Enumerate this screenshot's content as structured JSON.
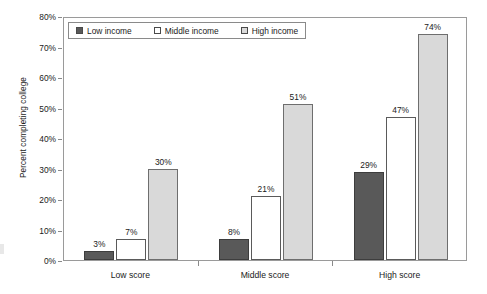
{
  "chart_data": {
    "type": "bar",
    "title": "",
    "subtitle": "",
    "xlabel": "",
    "ylabel": "Percent completing college",
    "categories": [
      "Low score",
      "Middle score",
      "High score"
    ],
    "series": [
      {
        "name": "Low income",
        "values": [
          3,
          7,
          29
        ],
        "labels": [
          "3%",
          "8%",
          "29%"
        ],
        "color": "#595959"
      },
      {
        "name": "Middle income",
        "values": [
          7,
          21,
          47
        ],
        "labels": [
          "7%",
          "21%",
          "47%"
        ],
        "color": "#ffffff"
      },
      {
        "name": "High income",
        "values": [
          30,
          51,
          74
        ],
        "labels": [
          "30%",
          "51%",
          "74%"
        ],
        "color": "#d9d9d9"
      }
    ],
    "ylim": [
      0,
      80
    ],
    "y_tick_values": [
      0,
      10,
      20,
      30,
      40,
      50,
      60,
      70,
      80
    ],
    "y_tick_labels": [
      "0%",
      "10%",
      "20%",
      "30%",
      "40%",
      "50%",
      "60%",
      "70%",
      "80%"
    ],
    "grid": false,
    "legend_position": "top-left-inside",
    "value_labels_shown": true
  },
  "legend": {
    "items": [
      {
        "label": "Low income",
        "swatch": "low"
      },
      {
        "label": "Middle income",
        "swatch": "middle"
      },
      {
        "label": "High income",
        "swatch": "high"
      }
    ]
  },
  "colors": {
    "low_income": "#595959",
    "middle_income": "#ffffff",
    "high_income": "#d9d9d9",
    "axis": "#9a9a9a",
    "text": "#1a1a1a",
    "background": "#ffffff"
  }
}
